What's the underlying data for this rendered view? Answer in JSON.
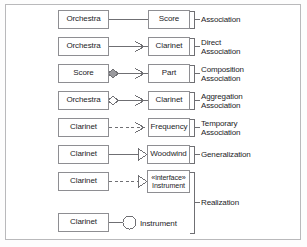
{
  "diagram": {
    "colors": {
      "box_border": "#8e8e92",
      "line": "#6f6f73",
      "frame_border": "#b9b9bb",
      "text": "#1d1d1f",
      "filled_diamond": "#9a9a9e",
      "background": "#ffffff"
    },
    "rows": [
      {
        "id": "association",
        "source_label": "Orchestra",
        "target_label": "Score",
        "relation_label": "Association",
        "line_style": "solid",
        "source_decoration": "none",
        "target_decoration": "none"
      },
      {
        "id": "direct-association",
        "source_label": "Orchestra",
        "target_label": "Clarinet",
        "relation_label": "Direct\nAssociation",
        "line_style": "solid",
        "source_decoration": "none",
        "target_decoration": "open-arrow"
      },
      {
        "id": "composition-association",
        "source_label": "Score",
        "target_label": "Part",
        "relation_label": "Composition\nAssociation",
        "line_style": "solid",
        "source_decoration": "filled-diamond",
        "target_decoration": "open-arrow"
      },
      {
        "id": "aggregation-association",
        "source_label": "Orchestra",
        "target_label": "Clarinet",
        "relation_label": "Aggregation\nAssociation",
        "line_style": "solid",
        "source_decoration": "hollow-diamond",
        "target_decoration": "open-arrow"
      },
      {
        "id": "temporary-association",
        "source_label": "Clarinet",
        "target_label": "Frequency",
        "relation_label": "Temporary\nAssociation",
        "line_style": "dashed",
        "source_decoration": "none",
        "target_decoration": "open-arrow"
      },
      {
        "id": "generalization",
        "source_label": "Clarinet",
        "target_label": "Woodwind",
        "relation_label": "Generalization",
        "line_style": "solid",
        "source_decoration": "none",
        "target_decoration": "hollow-triangle"
      },
      {
        "id": "realization-interface",
        "source_label": "Clarinet",
        "target_stereotype": "«interface»",
        "target_label": "Instrument",
        "relation_label": "Realization",
        "line_style": "dashed",
        "source_decoration": "none",
        "target_decoration": "hollow-triangle"
      },
      {
        "id": "realization-lollipop",
        "source_label": "Clarinet",
        "target_label": "Instrument",
        "relation_label": "",
        "line_style": "solid",
        "source_decoration": "none",
        "target_decoration": "lollipop-circle"
      }
    ]
  }
}
